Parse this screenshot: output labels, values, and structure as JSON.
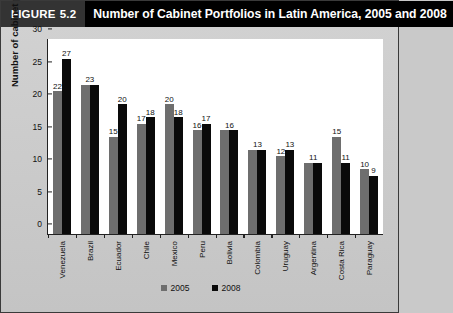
{
  "header": {
    "figure_word": "FIGURE",
    "figure_number": "5.2",
    "title": "Number of Cabinet Portfolios in Latin America, 2005 and 2008"
  },
  "legend": {
    "items": [
      {
        "label": "2005",
        "color": "#6e6e6e"
      },
      {
        "label": "2008",
        "color": "#0a0a0a"
      }
    ]
  },
  "chart_data": {
    "type": "bar",
    "title": "Number of Cabinet Portfolios in Latin America, 2005 and 2008",
    "xlabel": "",
    "ylabel": "Number of cabinet portfolios",
    "ylim": [
      0,
      30
    ],
    "yticks": [
      "0",
      "5",
      "10",
      "15",
      "20",
      "25",
      "30"
    ],
    "grid": false,
    "legend_position": "bottom",
    "categories": [
      "Venezuela",
      "Brazil",
      "Ecuador",
      "Chile",
      "Mexico",
      "Peru",
      "Bolivia",
      "Colombia",
      "Uruguay",
      "Argentina",
      "Costa Rica",
      "Paraguay"
    ],
    "series": [
      {
        "name": "2005",
        "color": "#6e6e6e",
        "values": [
          22,
          23,
          15,
          17,
          20,
          16,
          16,
          13,
          12,
          11,
          15,
          10
        ]
      },
      {
        "name": "2008",
        "color": "#0a0a0a",
        "values": [
          27,
          23,
          20,
          18,
          18,
          17,
          16,
          13,
          13,
          11,
          11,
          9
        ]
      }
    ],
    "shared_labels": [
      false,
      true,
      false,
      false,
      false,
      false,
      true,
      true,
      false,
      true,
      false,
      false
    ]
  }
}
